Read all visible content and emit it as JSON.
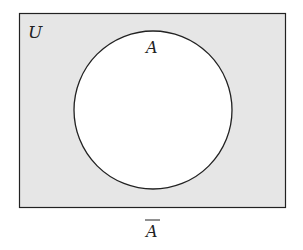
{
  "diagram": {
    "type": "venn",
    "universe_label": "U",
    "set_label": "A",
    "complement_label": "A",
    "complement_overline": true,
    "colors": {
      "universe_fill": "#e6e6e6",
      "set_fill": "#ffffff",
      "stroke": "#222222"
    }
  }
}
